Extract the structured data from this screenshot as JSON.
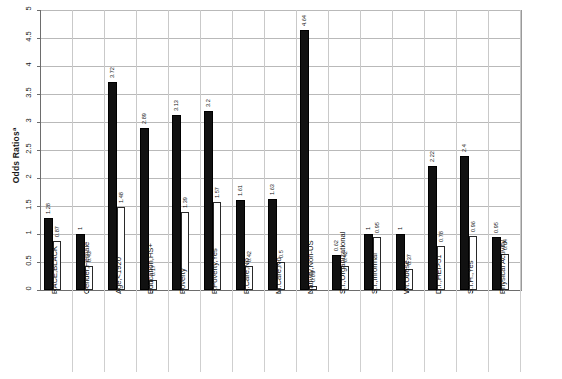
{
  "chart_data": {
    "type": "bar",
    "title": "",
    "xlabel": "",
    "ylabel": "Odds Ratios",
    "ylabel_superscript": "a",
    "ylim": [
      0,
      5
    ],
    "ytick_values": [
      0,
      0.5,
      1,
      1.5,
      2,
      2.5,
      3,
      3.5,
      4,
      4.5,
      5
    ],
    "ytick_labels": [
      "0",
      "0.5",
      "1",
      "1.5",
      "2",
      "2.5",
      "3",
      "3.5",
      "4",
      "4.5",
      "5"
    ],
    "grid": true,
    "legend_position": "none",
    "categories": [
      "RACE,BLACK",
      "Gender,Female",
      "Age,<1920",
      "Education,HS+",
      "Poverty",
      "P.Poverty,Yes",
      "R.Care,No",
      "M.Care,No",
      "Nativity,Non-US",
      "S.I.,Organizational",
      "S.I.,Informal",
      "Wt.Obese",
      "D.I.,HEI>51",
      "S.I.H.,Yes",
      "Physical Activity"
    ],
    "series": [
      {
        "name": "solid",
        "style": "solid-black",
        "values": [
          1.28,
          1,
          3.72,
          2.89,
          3.13,
          3.2,
          1.61,
          1.63,
          4.64,
          0.62,
          1,
          1,
          2.22,
          2.4,
          0.95
        ],
        "labels": [
          "1.28",
          "1",
          "3.72",
          "2.89",
          "3.13",
          "3.2",
          "1.61",
          "1.63",
          "4.64",
          "0.62",
          "1",
          "1",
          "2.22",
          "2.4",
          "0.95"
        ]
      },
      {
        "name": "hollow",
        "style": "hollow-white",
        "values": [
          0.87,
          0.43,
          1.48,
          0.17,
          1.39,
          1.57,
          0.42,
          0.5,
          0.07,
          0.42,
          0.95,
          0.37,
          0.78,
          0.96,
          0.64
        ],
        "labels": [
          "0.87",
          "0.43",
          "1.48",
          "0.17",
          "1.39",
          "1.57",
          "0.42",
          "0.5",
          "0.07",
          "0.42",
          "0.95",
          "0.37",
          "0.78",
          "0.96",
          "0.64"
        ]
      }
    ]
  },
  "axis": {
    "y_title": "Odds Ratios",
    "y_title_sup": "a"
  }
}
